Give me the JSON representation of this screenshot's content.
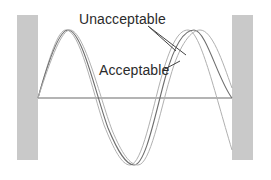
{
  "diagram": {
    "labels": {
      "unacceptable": "Unacceptable",
      "acceptable": "Acceptable"
    },
    "colors": {
      "pillar": "#c8c8c8",
      "baseline": "#6a6a6a",
      "wave_acceptable": "#6e6e6e",
      "wave_unacceptable": "#a9a9a9",
      "text": "#2b2b2b",
      "pointer": "#444444"
    },
    "elements": [
      "left-pillar",
      "right-pillar",
      "baseline",
      "acceptable-wave",
      "unacceptable-wave-shifted-left",
      "unacceptable-wave-shifted-right"
    ]
  }
}
